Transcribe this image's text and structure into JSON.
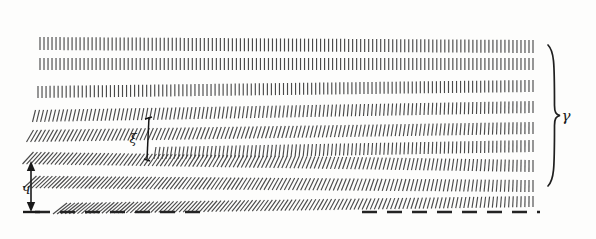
{
  "figure": {
    "background_color": "#fdfdfc",
    "ink_color": "#4a4a4a",
    "annotation_color": "#1a1a1a",
    "width": 596,
    "height": 239
  },
  "annotations": {
    "right_brace_label": "γ",
    "left_dimension_label": "ч",
    "middle_bracket_label": "ξ"
  },
  "elements": {
    "right_brace": {
      "name": "right-brace",
      "x": 551,
      "y_top": 45,
      "y_bottom": 186,
      "label_x": 566,
      "label_y": 121
    },
    "left_dimension_arrow": {
      "name": "left-vertical-dimension-arrow",
      "x": 31,
      "y_top": 161,
      "y_bottom": 212,
      "label_x": 26,
      "label_y": 194
    },
    "middle_bracket": {
      "name": "middle-vertical-bracket",
      "x": 149,
      "y_top": 117,
      "y_bottom": 159,
      "label_x": 133,
      "label_y": 142
    },
    "baseline_dashed": {
      "name": "baseline-dashed-line",
      "y": 212,
      "segment_left": {
        "x_start": 35,
        "x_end": 205
      },
      "segment_right": {
        "x_start": 362,
        "x_end": 540
      },
      "dash_length": 15,
      "gap_length": 10
    }
  },
  "hatch_rows": [
    {
      "id": "row-1",
      "x_start": 40,
      "x_end": 533,
      "y_left": 37,
      "y_right": 40,
      "tick_height": 13,
      "spacing": 4.0,
      "slant_left": 0,
      "slant_right": 0
    },
    {
      "id": "row-2",
      "x_start": 40,
      "x_end": 533,
      "y_left": 58,
      "y_right": 58,
      "tick_height": 12,
      "spacing": 4.0,
      "slant_left": 0,
      "slant_right": 0
    },
    {
      "id": "row-3",
      "x_start": 38,
      "x_end": 533,
      "y_left": 86,
      "y_right": 80,
      "tick_height": 12,
      "spacing": 4.0,
      "slant_left": 0,
      "slant_right": 0
    },
    {
      "id": "row-4",
      "x_start": 34,
      "x_end": 533,
      "y_left": 110,
      "y_right": 101,
      "tick_height": 12,
      "spacing": 4.0,
      "slant_left": 3,
      "slant_right": 0
    },
    {
      "id": "row-5",
      "x_start": 30,
      "x_end": 533,
      "y_left": 130,
      "y_right": 122,
      "tick_height": 12,
      "spacing": 4.0,
      "slant_left": 7,
      "slant_right": 0
    },
    {
      "id": "row-6",
      "x_start": 155,
      "x_end": 533,
      "y_left": 147,
      "y_right": 140,
      "tick_height": 12,
      "spacing": 4.0,
      "slant_left": 2,
      "slant_right": 0
    },
    {
      "id": "row-7",
      "x_start": 28,
      "x_end": 533,
      "y_left": 152,
      "y_right": 160,
      "tick_height": 12,
      "spacing": 4.0,
      "slant_left": 11,
      "slant_right": 0
    },
    {
      "id": "row-8",
      "x_start": 30,
      "x_end": 533,
      "y_left": 176,
      "y_right": 180,
      "tick_height": 12,
      "spacing": 4.0,
      "slant_left": 13,
      "slant_right": 0
    },
    {
      "id": "row-9",
      "x_start": 60,
      "x_end": 533,
      "y_left": 203,
      "y_right": 196,
      "tick_height": 11,
      "spacing": 4.0,
      "slant_left": 14,
      "slant_right": 0
    }
  ],
  "chart_data": {
    "type": "diagram",
    "row_count": 9,
    "tick_spacing_px": 4,
    "tick_height_px": 12
  }
}
